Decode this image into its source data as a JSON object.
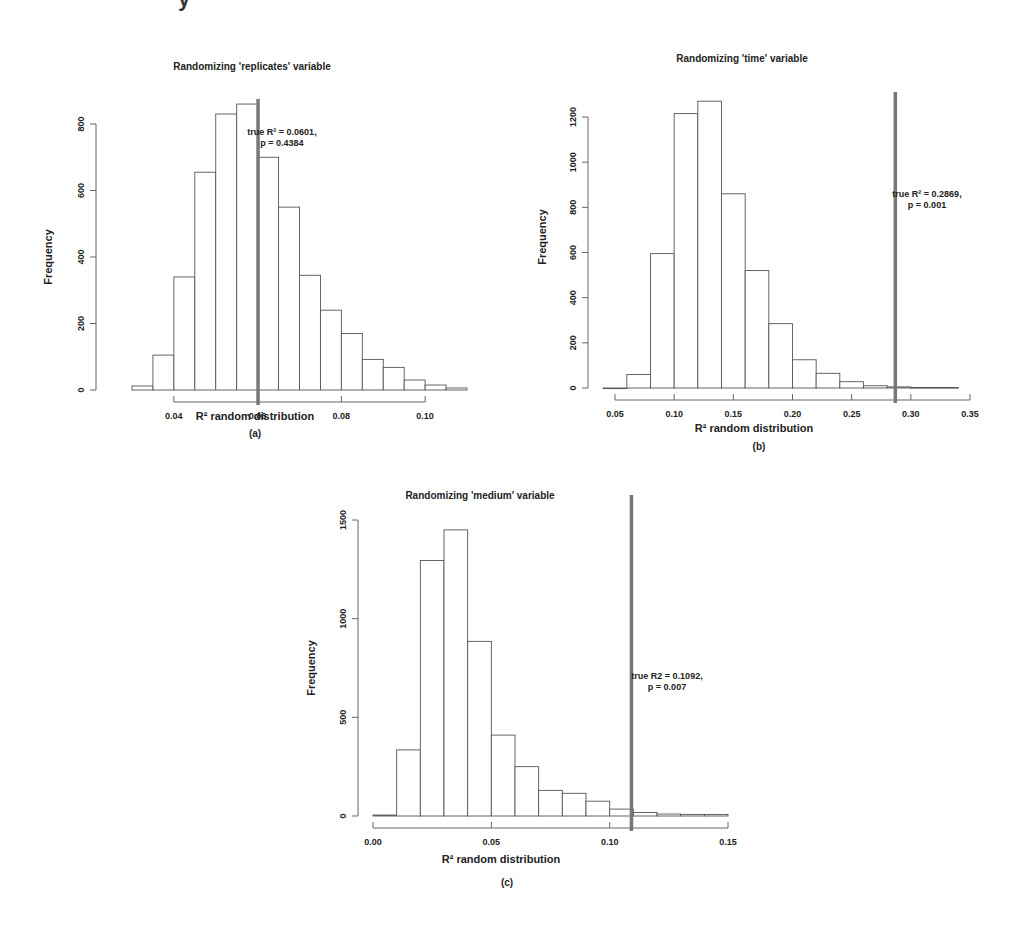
{
  "top_fragment": "y",
  "chart_data": [
    {
      "id": "a",
      "type": "bar",
      "subtype": "histogram",
      "title": "Randomizing 'replicates' variable",
      "xlabel": "R² random distribution",
      "ylabel": "Frequency",
      "caption": "(a)",
      "bin_width": 0.005,
      "bin_starts": [
        0.03,
        0.035,
        0.04,
        0.045,
        0.05,
        0.055,
        0.06,
        0.065,
        0.07,
        0.075,
        0.08,
        0.085,
        0.09,
        0.095,
        0.1,
        0.105
      ],
      "values": [
        12,
        105,
        340,
        655,
        830,
        860,
        700,
        550,
        345,
        240,
        170,
        92,
        68,
        30,
        15,
        6
      ],
      "xticks": [
        0.04,
        0.06,
        0.08,
        0.1
      ],
      "xtick_labels": [
        "0.04",
        "0.06",
        "0.08",
        "0.10"
      ],
      "yticks": [
        0,
        200,
        400,
        600,
        800
      ],
      "yticick_labels": [
        "0",
        "200",
        "400",
        "600",
        "800"
      ],
      "xlim": [
        0.03,
        0.11
      ],
      "ylim": [
        0,
        860
      ],
      "reference_line": {
        "x": 0.0601,
        "label_line1": "true R² = 0.0601,",
        "label_line2": "p = 0.4384"
      },
      "grid": false,
      "legend": null
    },
    {
      "id": "b",
      "type": "bar",
      "subtype": "histogram",
      "title": "Randomizing 'time' variable",
      "xlabel": "R² random distribution",
      "ylabel": "Frequency",
      "caption": "(b)",
      "bin_width": 0.02,
      "bin_starts": [
        0.04,
        0.06,
        0.08,
        0.1,
        0.12,
        0.14,
        0.16,
        0.18,
        0.2,
        0.22,
        0.24,
        0.26,
        0.28,
        0.3,
        0.32
      ],
      "values": [
        0,
        60,
        595,
        1215,
        1270,
        860,
        520,
        285,
        125,
        65,
        28,
        10,
        5,
        2,
        2
      ],
      "xticks": [
        0.05,
        0.1,
        0.15,
        0.2,
        0.25,
        0.3,
        0.35
      ],
      "xtick_labels": [
        "0.05",
        "0.10",
        "0.15",
        "0.20",
        "0.25",
        "0.30",
        "0.35"
      ],
      "yticks": [
        0,
        200,
        400,
        600,
        800,
        1000,
        1200
      ],
      "ytick_labels": [
        "0",
        "200",
        "400",
        "600",
        "800",
        "1000",
        "1200"
      ],
      "xlim": [
        0.04,
        0.35
      ],
      "ylim": [
        0,
        1270
      ],
      "reference_line": {
        "x": 0.2869,
        "label_line1": "true R² = 0.2869,",
        "label_line2": "p = 0.001"
      },
      "grid": false,
      "legend": null
    },
    {
      "id": "c",
      "type": "bar",
      "subtype": "histogram",
      "title": "Randomizing 'medium' variable",
      "xlabel": "R² random distribution",
      "ylabel": "Frequency",
      "caption": "(c)",
      "bin_width": 0.01,
      "bin_starts": [
        0.0,
        0.01,
        0.02,
        0.03,
        0.04,
        0.05,
        0.06,
        0.07,
        0.08,
        0.09,
        0.1,
        0.11,
        0.12,
        0.13,
        0.14
      ],
      "values": [
        5,
        335,
        1295,
        1450,
        885,
        410,
        250,
        130,
        115,
        75,
        35,
        18,
        10,
        8,
        8
      ],
      "xticks": [
        0.0,
        0.05,
        0.1,
        0.15
      ],
      "xtick_labels": [
        "0.00",
        "0.05",
        "0.10",
        "0.15"
      ],
      "yticks": [
        0,
        500,
        1000,
        1500
      ],
      "ytick_labels": [
        "0",
        "500",
        "1000",
        "1500"
      ],
      "xlim": [
        0.0,
        0.15
      ],
      "ylim": [
        0,
        1500
      ],
      "reference_line": {
        "x": 0.1092,
        "label_line1": "true R2 = 0.1092,",
        "label_line2": "p = 0.007"
      },
      "grid": false,
      "legend": null
    }
  ],
  "layout": {
    "a": {
      "x0": 132,
      "x1": 467,
      "xmin": 0.03,
      "xmax": 0.11,
      "y0": 390,
      "ytop": 124,
      "ytop_val": 800,
      "yaxis_x": 96,
      "xaxis_y": 402,
      "title_x": 252,
      "title_y": 70,
      "ylabel_x": 52,
      "ylabel_y": 257,
      "xlabel_x": 255,
      "xlabel_y": 420,
      "cap_x": 255,
      "cap_y": 437,
      "ann_x": 282,
      "ann_y": 135
    },
    "b": {
      "x0": 615,
      "x1": 970,
      "xmin": 0.05,
      "xmax": 0.35,
      "y0": 388,
      "ytop": 117,
      "ytop_val": 1200,
      "yaxis_x": 588,
      "xaxis_y": 400,
      "title_x": 742,
      "title_y": 62,
      "ylabel_x": 546,
      "ylabel_y": 237,
      "xlabel_x": 754,
      "xlabel_y": 432,
      "cap_x": 759,
      "cap_y": 450,
      "ann_x": 927,
      "ann_y": 197
    },
    "c": {
      "x0": 373,
      "x1": 728,
      "xmin": 0.0,
      "xmax": 0.15,
      "y0": 816,
      "ytop": 520,
      "ytop_val": 1500,
      "yaxis_x": 358,
      "xaxis_y": 828,
      "title_x": 480,
      "title_y": 499,
      "ylabel_x": 315,
      "ylabel_y": 668,
      "xlabel_x": 501,
      "xlabel_y": 863,
      "cap_x": 507,
      "cap_y": 886,
      "ann_x": 667,
      "ann_y": 679
    }
  }
}
